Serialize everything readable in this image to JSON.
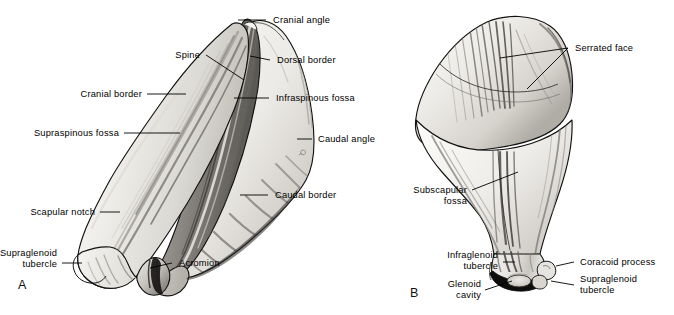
{
  "figure": {
    "panels": [
      {
        "id": "A",
        "letter": "A",
        "view": "lateral-view",
        "labels": [
          {
            "key": "cranial_angle",
            "text": "Cranial angle"
          },
          {
            "key": "spine",
            "text": "Spine"
          },
          {
            "key": "dorsal_border",
            "text": "Dorsal border"
          },
          {
            "key": "cranial_border",
            "text": "Cranial border"
          },
          {
            "key": "infraspinous_fossa",
            "text": "Infraspinous fossa"
          },
          {
            "key": "supraspinous_fossa",
            "text": "Supraspinous fossa"
          },
          {
            "key": "caudal_angle",
            "text": "Caudal angle"
          },
          {
            "key": "caudal_border",
            "text": "Caudal border"
          },
          {
            "key": "scapular_notch",
            "text": "Scapular notch"
          },
          {
            "key": "supraglenoid_tubercle_line1",
            "text": "Supraglenoid"
          },
          {
            "key": "supraglenoid_tubercle_line2",
            "text": "tubercle"
          },
          {
            "key": "acromion",
            "text": "Acromion"
          }
        ]
      },
      {
        "id": "B",
        "letter": "B",
        "view": "medial-costal-view",
        "labels": [
          {
            "key": "serrated_face",
            "text": "Serrated face"
          },
          {
            "key": "subscapular_fossa_line1",
            "text": "Subscapular"
          },
          {
            "key": "subscapular_fossa_line2",
            "text": "fossa"
          },
          {
            "key": "infraglenoid_tubercle_line1",
            "text": "Infraglenoid"
          },
          {
            "key": "infraglenoid_tubercle_line2",
            "text": "tubercle"
          },
          {
            "key": "glenoid_cavity_line1",
            "text": "Glenoid"
          },
          {
            "key": "glenoid_cavity_line2",
            "text": "cavity"
          },
          {
            "key": "coracoid_process",
            "text": "Coracoid process"
          },
          {
            "key": "supraglenoid_tubercle_line1",
            "text": "Supraglenoid"
          },
          {
            "key": "supraglenoid_tubercle_line2",
            "text": "tubercle"
          }
        ]
      }
    ],
    "caption": "",
    "colors": {
      "background": "#ffffff",
      "ink": "#000000",
      "outline": "#121212",
      "bone_light": "#f2f1ee",
      "bone_mid": "#d8d6d1",
      "bone_shadow": "#9a9792",
      "bone_dark": "#5d5b57",
      "leader": "#000000"
    }
  }
}
